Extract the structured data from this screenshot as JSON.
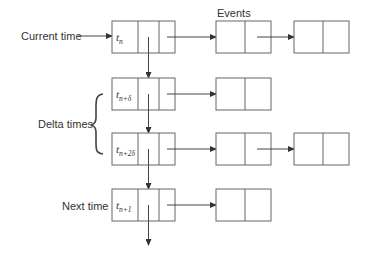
{
  "diagram": {
    "title_label": "Events",
    "labels": {
      "current_time": "Current time",
      "delta_times": "Delta times",
      "next_time": "Next time"
    },
    "time_nodes": [
      {
        "base": "t",
        "sub": "n",
        "event_count": 2
      },
      {
        "base": "t",
        "sub": "n+δ",
        "event_count": 1
      },
      {
        "base": "t",
        "sub": "n+2δ",
        "event_count": 2
      },
      {
        "base": "t",
        "sub": "n+1",
        "event_count": 1
      }
    ],
    "colors": {
      "stroke": "#666666",
      "text": "#333333",
      "background": "#ffffff"
    }
  }
}
